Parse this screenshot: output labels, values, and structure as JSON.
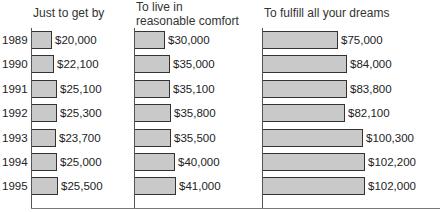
{
  "chart_data": {
    "type": "bar",
    "orientation": "horizontal",
    "categories": [
      "1989",
      "1990",
      "1991",
      "1992",
      "1993",
      "1994",
      "1995"
    ],
    "series": [
      {
        "name": "Just to get by",
        "values": [
          20000,
          22100,
          25100,
          25300,
          23700,
          25000,
          25500
        ],
        "labels": [
          "$20,000",
          "$22,100",
          "$25,100",
          "$25,300",
          "$23,700",
          "$25,000",
          "$25,500"
        ]
      },
      {
        "name": "To live in reasonable comfort",
        "title_lines": [
          "To live in",
          "reasonable comfort"
        ],
        "values": [
          30000,
          35000,
          35100,
          35800,
          35500,
          40000,
          41000
        ],
        "labels": [
          "$30,000",
          "$35,000",
          "$35,100",
          "$35,800",
          "$35,500",
          "$40,000",
          "$41,000"
        ]
      },
      {
        "name": "To fulfill all your dreams",
        "values": [
          75000,
          84000,
          83800,
          82100,
          100300,
          102200,
          102000
        ],
        "labels": [
          "$75,000",
          "$84,000",
          "$83,800",
          "$82,100",
          "$100,300",
          "$102,200",
          "$102,000"
        ]
      }
    ],
    "title": "",
    "xlabel": "",
    "ylabel": "",
    "grid": false,
    "legend": "none (panel titles above each column)",
    "bar_color": "#c9c9c9",
    "bar_border": "#333333"
  },
  "panels": [
    {
      "title1": "Just to get by",
      "title2": ""
    },
    {
      "title1": "To live in",
      "title2": "reasonable comfort"
    },
    {
      "title1": "To fulfill all your dreams",
      "title2": ""
    }
  ]
}
